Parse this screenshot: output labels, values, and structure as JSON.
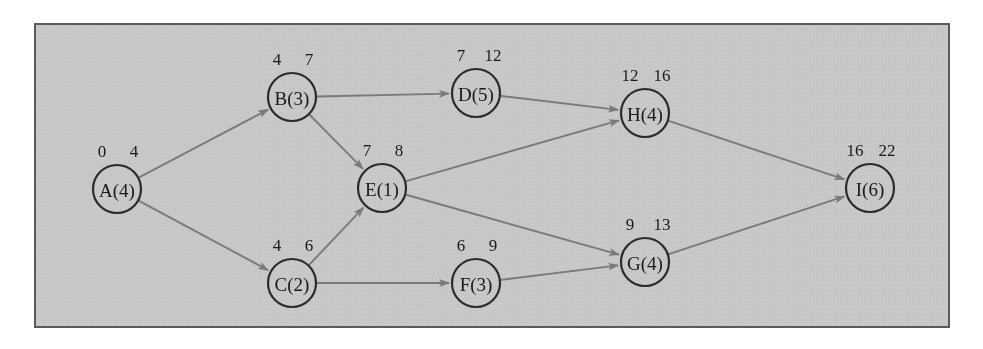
{
  "diagram": {
    "background_color": "#c9c9c9",
    "border_color": "#5a5a5a",
    "node_stroke_color": "#2b2b2b",
    "edge_color": "#7a7a7a",
    "node_radius": 24,
    "nodes": [
      {
        "id": "A",
        "label": "A(4)",
        "duration": 4,
        "earliest": "0",
        "latest": "4",
        "cx": 117,
        "cy": 189
      },
      {
        "id": "B",
        "label": "B(3)",
        "duration": 3,
        "earliest": "4",
        "latest": "7",
        "cx": 292,
        "cy": 97
      },
      {
        "id": "C",
        "label": "C(2)",
        "duration": 2,
        "earliest": "4",
        "latest": "6",
        "cx": 292,
        "cy": 283
      },
      {
        "id": "D",
        "label": "D(5)",
        "duration": 5,
        "earliest": "7",
        "latest": "12",
        "cx": 476,
        "cy": 93
      },
      {
        "id": "E",
        "label": "E(1)",
        "duration": 1,
        "earliest": "7",
        "latest": "8",
        "cx": 382,
        "cy": 188
      },
      {
        "id": "F",
        "label": "F(3)",
        "duration": 3,
        "earliest": "6",
        "latest": "9",
        "cx": 476,
        "cy": 283
      },
      {
        "id": "G",
        "label": "G(4)",
        "duration": 4,
        "earliest": "9",
        "latest": "13",
        "cx": 645,
        "cy": 262
      },
      {
        "id": "H",
        "label": "H(4)",
        "duration": 4,
        "earliest": "12",
        "latest": "16",
        "cx": 645,
        "cy": 113
      },
      {
        "id": "I",
        "label": "I(6)",
        "duration": 6,
        "earliest": "16",
        "latest": "22",
        "cx": 870,
        "cy": 188
      }
    ],
    "edges": [
      {
        "from": "A",
        "to": "B"
      },
      {
        "from": "A",
        "to": "C"
      },
      {
        "from": "B",
        "to": "D"
      },
      {
        "from": "B",
        "to": "E"
      },
      {
        "from": "C",
        "to": "E"
      },
      {
        "from": "C",
        "to": "F"
      },
      {
        "from": "D",
        "to": "H"
      },
      {
        "from": "E",
        "to": "H"
      },
      {
        "from": "E",
        "to": "G"
      },
      {
        "from": "F",
        "to": "G"
      },
      {
        "from": "H",
        "to": "I"
      },
      {
        "from": "G",
        "to": "I"
      }
    ]
  }
}
